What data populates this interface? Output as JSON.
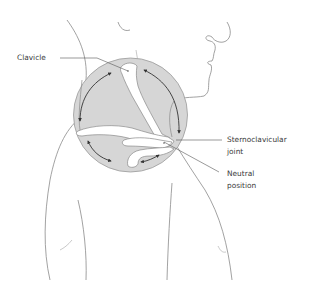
{
  "figure": {
    "labels": {
      "clavicle": "Clavicle",
      "sc_joint_line1": "Sternoclavicular",
      "sc_joint_line2": "joint",
      "neutral_line1": "Neutral",
      "neutral_line2": "position"
    },
    "colors": {
      "outline": "#8a8a8a",
      "circle_fill": "#d6d6d6",
      "circle_stroke": "#9a9a9a",
      "bone_fill": "#ffffff",
      "arrow": "#333333",
      "text": "#3a3a3a",
      "leader": "#555555"
    },
    "arrows": [
      "elevation",
      "depression",
      "protraction",
      "retraction",
      "anterior-posterior"
    ]
  }
}
